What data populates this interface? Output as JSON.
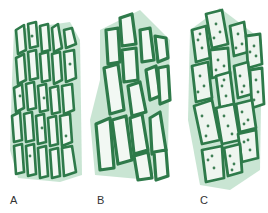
{
  "figure": {
    "panels": [
      {
        "id": "A",
        "label": "A",
        "description": "small elongated cells with few chloroplasts"
      },
      {
        "id": "B",
        "label": "B",
        "description": "larger elongated cells with no visible chloroplasts"
      },
      {
        "id": "C",
        "label": "C",
        "description": "cells filled with many chloroplasts"
      }
    ],
    "colors": {
      "cell_wall": "#2e7a4a",
      "cell_halo": "#9ccfae",
      "cell_interior": "#f2f8f3",
      "chloroplast": "#3f7f55"
    }
  }
}
